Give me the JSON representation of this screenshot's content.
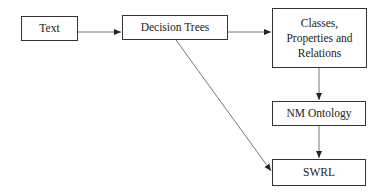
{
  "diagram": {
    "nodes": [
      {
        "id": "text",
        "label": "Text"
      },
      {
        "id": "decision_trees",
        "label": "Decision Trees"
      },
      {
        "id": "classes",
        "label": "Classes, Properties and Relations"
      },
      {
        "id": "nm_ontology",
        "label": "NM Ontology"
      },
      {
        "id": "swrl",
        "label": "SWRL"
      }
    ],
    "edges": [
      {
        "from": "text",
        "to": "decision_trees"
      },
      {
        "from": "decision_trees",
        "to": "classes"
      },
      {
        "from": "classes",
        "to": "nm_ontology"
      },
      {
        "from": "nm_ontology",
        "to": "swrl"
      },
      {
        "from": "decision_trees",
        "to": "swrl"
      }
    ],
    "colors": {
      "stroke": "#333333",
      "edge": "#666666",
      "background": "#ffffff"
    }
  }
}
